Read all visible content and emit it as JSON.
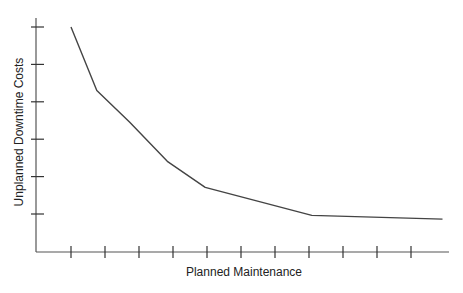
{
  "chart_data": {
    "type": "line",
    "title": "",
    "xlabel": "Planned Maintenance",
    "ylabel": "Unplanned Downtime Costs",
    "x_ticks": 11,
    "y_ticks": 6,
    "tick_labels_shown": false,
    "grid": false,
    "legend": null,
    "x": [
      0.0,
      0.75,
      1.7,
      2.8,
      3.9,
      7.0,
      10.8
    ],
    "values": [
      6.0,
      4.3,
      3.45,
      2.4,
      1.7,
      0.95,
      0.85
    ],
    "xlim": [
      -1,
      11.2
    ],
    "ylim": [
      -0.8,
      6.3
    ]
  },
  "colors": {
    "axis": "#555555",
    "line": "#444444",
    "text": "#222222"
  }
}
